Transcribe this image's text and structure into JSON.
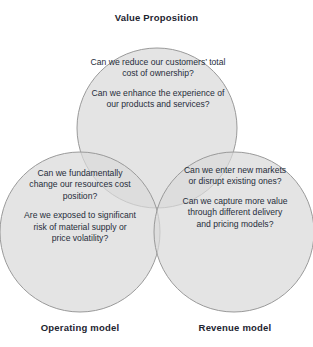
{
  "diagram": {
    "type": "venn-3-circle",
    "title_label": "Value Proposition",
    "left_label": "Operating model",
    "right_label": "Revenue model",
    "colors": {
      "circle_fill": "#d9d9d9",
      "circle_stroke": "#9a9a9a",
      "text": "#262d3a",
      "background": "#ffffff"
    },
    "circles": {
      "top": {
        "name": "Value Proposition",
        "cx": 157,
        "cy": 128,
        "r": 80,
        "paragraphs": [
          "Can we reduce our customers’ total cost of ownership?",
          "Can we enhance the experience of our products and services?"
        ]
      },
      "left": {
        "name": "Operating model",
        "cx": 80,
        "cy": 232,
        "r": 80,
        "paragraphs": [
          "Can we fundamentally change our resources cost position?",
          "Are we exposed to significant risk of material supply or price volatility?"
        ]
      },
      "right": {
        "name": "Revenue model",
        "cx": 234,
        "cy": 232,
        "r": 80,
        "paragraphs": [
          "Can we enter new markets or disrupt existing ones?",
          "Can we capture more value through different delivery and pricing models?"
        ]
      }
    }
  }
}
